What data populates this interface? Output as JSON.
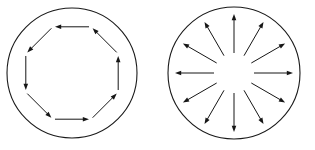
{
  "figure": {
    "background_color": "#ffffff",
    "stroke_color": "#161616",
    "width": 315,
    "height": 150
  },
  "panels": [
    {
      "id": "left-panel",
      "name": "rotational-field",
      "label": "Counterclockwise circulation field",
      "circle": {
        "cx": 72,
        "cy": 73,
        "r": 65
      },
      "arrow_count": 8,
      "arrow_style": "tangential",
      "direction": "counterclockwise",
      "arrow_ring_radius": 50,
      "arrows": [
        {
          "name": "arrow-top",
          "angle_deg": 90,
          "points_toward": "left"
        },
        {
          "name": "arrow-top-left",
          "angle_deg": 135,
          "points_toward": "down-left"
        },
        {
          "name": "arrow-left",
          "angle_deg": 180,
          "points_toward": "down"
        },
        {
          "name": "arrow-bottom-left",
          "angle_deg": 225,
          "points_toward": "down-right"
        },
        {
          "name": "arrow-bottom",
          "angle_deg": 270,
          "points_toward": "right"
        },
        {
          "name": "arrow-bottom-right",
          "angle_deg": 315,
          "points_toward": "up-right"
        },
        {
          "name": "arrow-right",
          "angle_deg": 0,
          "points_toward": "up"
        },
        {
          "name": "arrow-top-right",
          "angle_deg": 45,
          "points_toward": "up-left"
        }
      ]
    },
    {
      "id": "right-panel",
      "name": "radial-field",
      "label": "Outward radial divergence field",
      "circle": {
        "cx": 234,
        "cy": 73,
        "r": 66
      },
      "arrow_count": 12,
      "arrow_style": "radial",
      "direction": "outward",
      "inner_radius": 20,
      "outer_radius": 59,
      "arrows": [
        {
          "name": "ray-000",
          "angle_deg": 0,
          "points_toward": "right"
        },
        {
          "name": "ray-030",
          "angle_deg": 30,
          "points_toward": "up-right"
        },
        {
          "name": "ray-060",
          "angle_deg": 60,
          "points_toward": "up-right"
        },
        {
          "name": "ray-090",
          "angle_deg": 90,
          "points_toward": "up"
        },
        {
          "name": "ray-120",
          "angle_deg": 120,
          "points_toward": "up-left"
        },
        {
          "name": "ray-150",
          "angle_deg": 150,
          "points_toward": "up-left"
        },
        {
          "name": "ray-180",
          "angle_deg": 180,
          "points_toward": "left"
        },
        {
          "name": "ray-210",
          "angle_deg": 210,
          "points_toward": "down-left"
        },
        {
          "name": "ray-240",
          "angle_deg": 240,
          "points_toward": "down-left"
        },
        {
          "name": "ray-270",
          "angle_deg": 270,
          "points_toward": "down"
        },
        {
          "name": "ray-300",
          "angle_deg": 300,
          "points_toward": "down-right"
        },
        {
          "name": "ray-330",
          "angle_deg": 330,
          "points_toward": "down-right"
        }
      ]
    }
  ]
}
